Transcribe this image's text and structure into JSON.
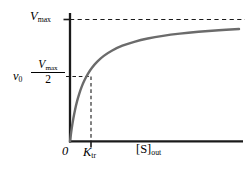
{
  "figure": {
    "title": "",
    "background_color": "#ffffff"
  },
  "chart_data": {
    "type": "line",
    "title": "",
    "subtitle": "",
    "xlabel": "[S]out",
    "ylabel": "v0",
    "grid": false,
    "legend": false,
    "axis_color": "#1a1a1a",
    "curve_color": "#6b6b6b",
    "dashed_color": "#1a1a1a",
    "xlim": [
      0,
      10.0
    ],
    "ylim": [
      0,
      1.12
    ],
    "equation": "v0 = Vmax * [S]out / (Ktr + [S]out)",
    "parameters": {
      "Vmax": 1.0,
      "Ktr": 0.85
    },
    "asymptote": {
      "value": 1.0,
      "label": "Vmax",
      "style": "dashed"
    },
    "half_saturation": {
      "y_value": 0.5,
      "y_label": "Vmax/2",
      "x_value": 0.85,
      "x_label": "Ktr",
      "style": "dashed"
    },
    "series": [
      {
        "name": "v0",
        "x": [
          0.0,
          0.1,
          0.2,
          0.3,
          0.42,
          0.55,
          0.7,
          0.85,
          1.05,
          1.3,
          1.6,
          2.0,
          2.5,
          3.1,
          3.8,
          4.6,
          5.5,
          6.5,
          7.6,
          8.8,
          10.0
        ],
        "y": [
          0.0,
          0.105,
          0.19,
          0.261,
          0.331,
          0.393,
          0.452,
          0.5,
          0.553,
          0.605,
          0.653,
          0.702,
          0.746,
          0.785,
          0.817,
          0.844,
          0.866,
          0.884,
          0.899,
          0.912,
          0.922
        ]
      }
    ],
    "yticks": [
      {
        "value": 1.0,
        "label": "Vmax"
      },
      {
        "value": 0.5,
        "label": "Vmax/2"
      }
    ],
    "xticks": [
      {
        "value": 0,
        "label": "0"
      },
      {
        "value": 0.85,
        "label": "Ktr"
      }
    ]
  },
  "labels": {
    "vmax": {
      "base": "V",
      "sub": "max"
    },
    "v_zero": {
      "base": "v",
      "sub": "0"
    },
    "half_max": {
      "numerator_base": "V",
      "numerator_sub": "max",
      "denominator": "2"
    },
    "origin": "0",
    "k_tr": {
      "base": "K",
      "sub": "tr"
    },
    "substrate": {
      "base": "[S]",
      "sub": "out"
    }
  }
}
